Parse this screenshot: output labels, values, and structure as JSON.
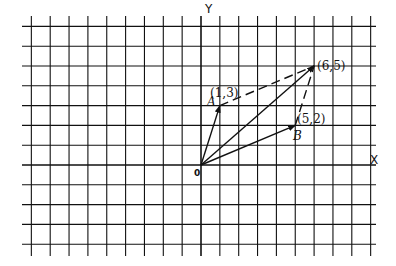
{
  "diagram": {
    "type": "vector-addition-grid",
    "axes": {
      "x_label": "X",
      "y_label": "Y",
      "origin_label": "0"
    },
    "grid": {
      "origin_px": [
        201,
        165
      ],
      "unit_x_px": 18.85,
      "unit_y_px": 19.8,
      "x_range": [
        -9,
        9
      ],
      "y_range": [
        -4,
        7
      ]
    },
    "points": [
      {
        "name": "A",
        "coords": [
          1,
          3
        ],
        "label": "(1,3)"
      },
      {
        "name": "B",
        "coords": [
          5,
          2
        ],
        "label": "(5,2)"
      },
      {
        "name": "sum",
        "coords": [
          6,
          5
        ],
        "label": "(6,5)"
      }
    ],
    "vectors": [
      {
        "from": [
          0,
          0
        ],
        "to": [
          1,
          3
        ],
        "style": "solid-arrow"
      },
      {
        "from": [
          0,
          0
        ],
        "to": [
          5,
          2
        ],
        "style": "solid-arrow"
      },
      {
        "from": [
          0,
          0
        ],
        "to": [
          6,
          5
        ],
        "style": "solid-arrow"
      },
      {
        "from": [
          1,
          3
        ],
        "to": [
          6,
          5
        ],
        "style": "dashed"
      },
      {
        "from": [
          5,
          2
        ],
        "to": [
          6,
          5
        ],
        "style": "dashed"
      }
    ],
    "colors": {
      "line": "#111111",
      "background": "#ffffff"
    }
  }
}
